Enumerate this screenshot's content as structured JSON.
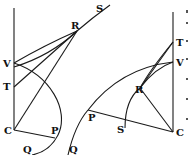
{
  "figures": [
    {
      "id": "left",
      "labels": {
        "S": "S",
        "R": "R",
        "V": "V",
        "T": "T",
        "C": "C",
        "P": "P",
        "Q": "Q"
      }
    },
    {
      "id": "right",
      "labels": {
        "T": "T",
        "V": "V",
        "R": "R",
        "P": "P",
        "S": "S",
        "C": "C",
        "Q": "Q"
      }
    }
  ]
}
